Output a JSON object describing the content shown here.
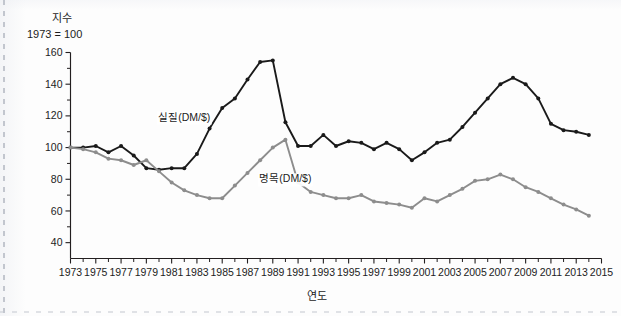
{
  "figure": {
    "unit_caption_line1": "지수",
    "unit_caption_line2": "1973 = 100",
    "x_axis_title": "연도"
  },
  "chart_data": {
    "type": "line",
    "title": "",
    "subtitle": "",
    "xlabel": "연도",
    "ylabel": "지수 (1973 = 100)",
    "xlim": [
      1973,
      2015
    ],
    "ylim": [
      30,
      160
    ],
    "ytick_labels": [
      "40",
      "60",
      "80",
      "100",
      "120",
      "140",
      "160"
    ],
    "ytick_values": [
      40,
      60,
      80,
      100,
      120,
      140,
      160
    ],
    "yminor_interval": 10,
    "xtick_labels": [
      "1973",
      "1975",
      "1977",
      "1979",
      "1981",
      "1983",
      "1985",
      "1987",
      "1989",
      "1991",
      "1993",
      "1995",
      "1997",
      "1999",
      "2001",
      "2003",
      "2005",
      "2007",
      "2009",
      "2011",
      "2013",
      "2015"
    ],
    "xtick_values": [
      1973,
      1975,
      1977,
      1979,
      1981,
      1983,
      1985,
      1987,
      1989,
      1991,
      1993,
      1995,
      1997,
      1999,
      2001,
      2003,
      2005,
      2007,
      2009,
      2011,
      2013,
      2015
    ],
    "grid": false,
    "legend_position": "inline-annotation",
    "x": [
      1973,
      1974,
      1975,
      1976,
      1977,
      1978,
      1979,
      1980,
      1981,
      1982,
      1983,
      1984,
      1985,
      1986,
      1987,
      1988,
      1989,
      1990,
      1991,
      1992,
      1993,
      1994,
      1995,
      1996,
      1997,
      1998,
      1999,
      2000,
      2001,
      2002,
      2003,
      2004,
      2005,
      2006,
      2007,
      2008,
      2009,
      2010,
      2011,
      2012,
      2013,
      2014
    ],
    "series": [
      {
        "name": "실질(DM/$)",
        "color": "#1a1a1a",
        "label_x": 1982,
        "label_y": 117,
        "values": [
          100,
          100,
          101,
          97,
          101,
          95,
          87,
          86,
          87,
          87,
          96,
          112,
          125,
          131,
          143,
          154,
          155,
          116,
          101,
          101,
          108,
          101,
          104,
          103,
          99,
          103,
          99,
          92,
          97,
          103,
          105,
          113,
          122,
          131,
          140,
          144,
          140,
          131,
          115,
          111,
          110,
          108
        ]
      },
      {
        "name": "명목(DM/$)",
        "color": "#8d8d8d",
        "label_x": 1990,
        "label_y": 78,
        "values": [
          100,
          99,
          97,
          93,
          92,
          89,
          92,
          85,
          78,
          73,
          70,
          68,
          68,
          76,
          84,
          92,
          100,
          105,
          78,
          72,
          70,
          68,
          68,
          70,
          66,
          65,
          64,
          62,
          68,
          66,
          70,
          74,
          79,
          80,
          83,
          80,
          75,
          72,
          68,
          64,
          61,
          57
        ]
      }
    ],
    "annotations": [
      {
        "text": "실질(DM/$)",
        "series": "real"
      },
      {
        "text": "명목(DM/$)",
        "series": "nominal"
      }
    ]
  },
  "colors": {
    "real_series": "#1a1a1a",
    "nominal_series": "#8d8d8d",
    "axis": "#231f20",
    "background": "#fdfdfd"
  }
}
